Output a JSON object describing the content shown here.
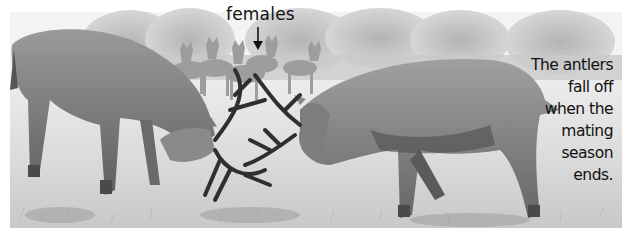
{
  "image": {
    "description": "Grayscale illustration of two red deer stags locking antlers in a grassy meadow, with a group of female deer (hinds) in the background among trees.",
    "palette": {
      "sky": "#f4f4f4",
      "trees": "#bdbdbd",
      "meadow": "#e6e6e6",
      "grass": "#cfcfcf",
      "deer_body": "#8a8a8a",
      "deer_shadow": "#4a4a4a",
      "antler": "#3a3a3a",
      "text": "#111111"
    }
  },
  "labels": {
    "females": "females",
    "caption_lines": [
      "The antlers",
      "fall off",
      "when the",
      "mating",
      "season",
      "ends."
    ]
  }
}
